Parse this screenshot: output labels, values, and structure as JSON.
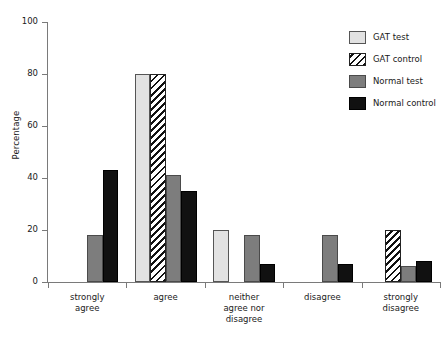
{
  "chart_data": {
    "type": "bar",
    "title": "",
    "xlabel": "",
    "ylabel": "Percentage",
    "ylim": [
      0,
      100
    ],
    "yticks": [
      0,
      20,
      40,
      60,
      80,
      100
    ],
    "grid": false,
    "legend_position": "top-right",
    "categories": [
      "strongly agree",
      "agree",
      "neither agree nor disagree",
      "disagree",
      "strongly disagree"
    ],
    "category_lines": [
      [
        "strongly",
        "agree"
      ],
      [
        "agree"
      ],
      [
        "neither",
        "agree nor",
        "disagree"
      ],
      [
        "disagree"
      ],
      [
        "strongly",
        "disagree"
      ]
    ],
    "series": [
      {
        "name": "GAT test",
        "color": "#e2e2e2",
        "pattern": "solid",
        "values": [
          0,
          80,
          20,
          0,
          0
        ]
      },
      {
        "name": "GAT control",
        "color": "#ffffff",
        "pattern": "diagonal-hatch",
        "values": [
          0,
          80,
          0,
          0,
          20
        ]
      },
      {
        "name": "Normal test",
        "color": "#7d7d7d",
        "pattern": "solid",
        "values": [
          18,
          41,
          18,
          18,
          6
        ]
      },
      {
        "name": "Normal control",
        "color": "#111111",
        "pattern": "solid",
        "values": [
          43,
          35,
          7,
          7,
          8
        ]
      }
    ]
  },
  "axis": {
    "y_title": "Percentage",
    "y_tick_labels": [
      "0",
      "20",
      "40",
      "60",
      "80",
      "100"
    ]
  },
  "legend": {
    "items": [
      {
        "label": "GAT test"
      },
      {
        "label": "GAT control"
      },
      {
        "label": "Normal test"
      },
      {
        "label": "Normal control"
      }
    ]
  }
}
